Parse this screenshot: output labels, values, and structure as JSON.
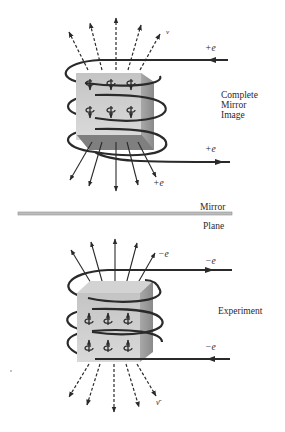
{
  "colors": {
    "ink": "#2a2a2a",
    "cube_front": "#c9c9c9",
    "cube_side": "#9a9a9a",
    "cube_top": "#d8d8d8",
    "cube_bottom": "#7a7a7a",
    "mirror": "#a8a8a8"
  },
  "top_figure": {
    "caption_lines": [
      "Complete",
      "Mirror",
      "Image"
    ],
    "current_in_label": "+e",
    "current_out_label": "+e",
    "emitted_particle_label": "+e",
    "neutrino_label": "ν",
    "spin_rows": 2,
    "spins_per_row": 3,
    "spin_direction": "down"
  },
  "mirror": {
    "label_top": "Mirror",
    "label_bottom": "Plane"
  },
  "bottom_figure": {
    "caption": "Experiment",
    "current_in_label": "−e",
    "current_out_label": "−e",
    "emitted_particle_label": "−e",
    "antineutrino_label": "ν̄",
    "spin_rows": 2,
    "spins_per_row": 3,
    "spin_direction": "up"
  }
}
